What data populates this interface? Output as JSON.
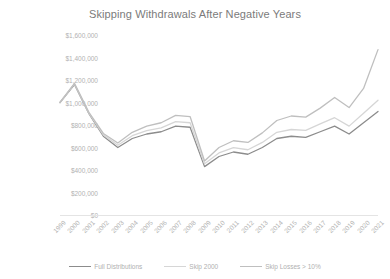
{
  "chart_data": {
    "type": "line",
    "title": "Skipping Withdrawals After Negative Years",
    "xlabel": "",
    "ylabel": "",
    "ylim": [
      0,
      1600000
    ],
    "ytick_labels": [
      "$1,600,000",
      "$1,400,000",
      "$1,200,000",
      "$1,000,000",
      "$800,000",
      "$600,000",
      "$400,000",
      "$200,000",
      "$0"
    ],
    "ytick_values": [
      1600000,
      1400000,
      1200000,
      1000000,
      800000,
      600000,
      400000,
      200000,
      0
    ],
    "grid": false,
    "legend_position": "bottom",
    "categories": [
      "1999",
      "2000",
      "2001",
      "2002",
      "2003",
      "2004",
      "2005",
      "2006",
      "2007",
      "2008",
      "2009",
      "2010",
      "2011",
      "2012",
      "2013",
      "2014",
      "2015",
      "2016",
      "2017",
      "2018",
      "2019",
      "2020",
      "2021"
    ],
    "series": [
      {
        "name": "Full Distributions",
        "color": "#8c8c8c",
        "values": [
          1000000,
          1160000,
          900000,
          700000,
          600000,
          680000,
          720000,
          740000,
          790000,
          780000,
          430000,
          520000,
          560000,
          540000,
          600000,
          680000,
          700000,
          690000,
          740000,
          790000,
          720000,
          820000,
          920000
        ]
      },
      {
        "name": "Skip 2000",
        "color": "#d6d6d6",
        "values": [
          1000000,
          1165000,
          905000,
          712000,
          620000,
          705000,
          750000,
          775000,
          830000,
          820000,
          455000,
          552000,
          598000,
          580000,
          645000,
          735000,
          760000,
          752000,
          810000,
          865000,
          790000,
          905000,
          1020000
        ]
      },
      {
        "name": "Skip Losses > 10%",
        "color": "#bfbfbf",
        "values": [
          1000000,
          1170000,
          912000,
          725000,
          640000,
          735000,
          790000,
          820000,
          885000,
          875000,
          480000,
          600000,
          660000,
          645000,
          730000,
          840000,
          880000,
          870000,
          950000,
          1045000,
          955000,
          1125000,
          1470000
        ]
      }
    ]
  },
  "legend": {
    "items": [
      {
        "label": "Full Distributions"
      },
      {
        "label": "Skip 2000"
      },
      {
        "label": "Skip Losses > 10%"
      }
    ]
  }
}
